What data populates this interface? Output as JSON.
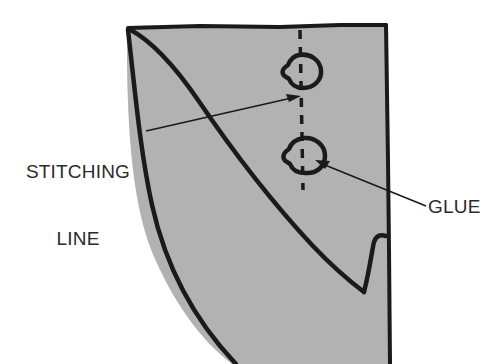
{
  "figure": {
    "background_color": "#ffffff",
    "fill_color": "#b2b2b2",
    "line_color": "#1a1a1a",
    "text_color": "#2b2b2b"
  },
  "labels": {
    "stitching_line": "STITCHING\nLINE",
    "stitching_line_1": "STITCHING",
    "stitching_line_2": "LINE",
    "glue": "GLUE"
  },
  "annotations": [
    {
      "name": "stitching-line",
      "text": "STITCHING LINE",
      "target": "dashed vertical line",
      "arrow_from": [
        148,
        131
      ],
      "arrow_to": [
        300,
        96
      ]
    },
    {
      "name": "glue",
      "text": "GLUE",
      "target": "lower glue blob",
      "arrow_from": [
        424,
        205
      ],
      "arrow_to": [
        316,
        160
      ]
    }
  ],
  "elements": {
    "panel": "shaded fabric panel",
    "stitching_line_style": "dashed",
    "glue_blobs": 2,
    "glue_blob_upper_center": [
      301,
      70
    ],
    "glue_blob_lower_center": [
      305,
      154
    ]
  }
}
